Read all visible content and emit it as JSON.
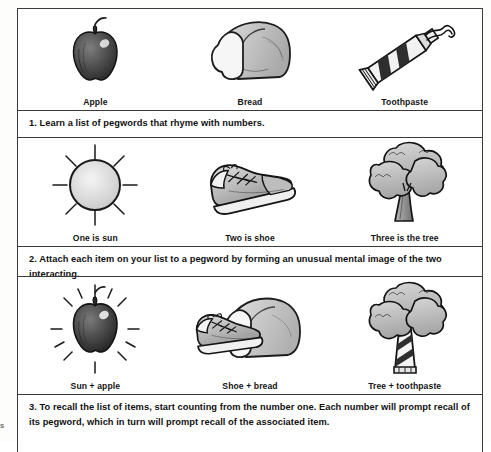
{
  "figure": {
    "edge_fragment": "s",
    "rows": [
      {
        "name": "items-row",
        "cells": [
          {
            "caption": "Apple",
            "icon": "apple-icon"
          },
          {
            "caption": "Bread",
            "icon": "bread-loaf-icon"
          },
          {
            "caption": "Toothpaste",
            "icon": "toothpaste-tube-icon"
          }
        ]
      },
      {
        "name": "pegwords-row",
        "cells": [
          {
            "caption": "One is sun",
            "icon": "sun-icon"
          },
          {
            "caption": "Two is shoe",
            "icon": "shoe-icon"
          },
          {
            "caption": "Three is the tree",
            "icon": "tree-icon"
          }
        ]
      },
      {
        "name": "combined-images-row",
        "cells": [
          {
            "caption": "Sun + apple",
            "icon": "sun-apple-icon"
          },
          {
            "caption": "Shoe + bread",
            "icon": "shoe-bread-icon"
          },
          {
            "caption": "Tree + toothpaste",
            "icon": "tree-toothpaste-icon"
          }
        ]
      }
    ],
    "steps": [
      "1. Learn a list of pegwords that rhyme with numbers.",
      "2. Attach each item on your list to a pegword by forming an unusual mental image of the two interacting.",
      "3. To recall the list of items, start counting from the number one. Each number will prompt recall of its pegword, which in turn will prompt recall of the associated item."
    ]
  },
  "colors": {
    "border": "#3a3a3a",
    "ink": "#111111",
    "paper": "#ffffff",
    "shade_light": "#d4d4d4",
    "shade_mid": "#a8a8a8",
    "shade_dark": "#4a4a4a"
  }
}
